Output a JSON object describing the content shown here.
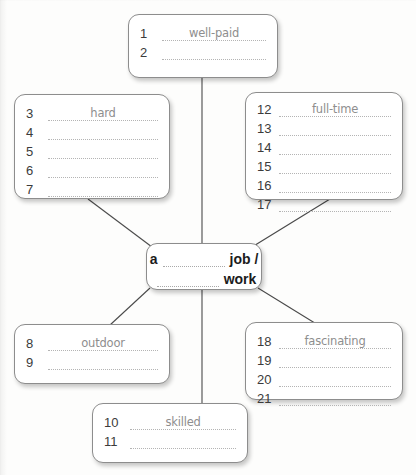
{
  "worksheet": {
    "center": {
      "lead": "a",
      "word1": "job /",
      "word2": "work"
    },
    "boxes": [
      {
        "name": "box-top",
        "items": [
          {
            "num": "1",
            "answer": "well-paid"
          },
          {
            "num": "2",
            "answer": ""
          }
        ]
      },
      {
        "name": "box-left-upper",
        "items": [
          {
            "num": "3",
            "answer": "hard"
          },
          {
            "num": "4",
            "answer": ""
          },
          {
            "num": "5",
            "answer": ""
          },
          {
            "num": "6",
            "answer": ""
          },
          {
            "num": "7",
            "answer": ""
          }
        ]
      },
      {
        "name": "box-right-upper",
        "items": [
          {
            "num": "12",
            "answer": "full-time"
          },
          {
            "num": "13",
            "answer": ""
          },
          {
            "num": "14",
            "answer": ""
          },
          {
            "num": "15",
            "answer": ""
          },
          {
            "num": "16",
            "answer": ""
          },
          {
            "num": "17",
            "answer": ""
          }
        ]
      },
      {
        "name": "box-left-lower",
        "items": [
          {
            "num": "8",
            "answer": "outdoor"
          },
          {
            "num": "9",
            "answer": ""
          }
        ]
      },
      {
        "name": "box-right-lower",
        "items": [
          {
            "num": "18",
            "answer": "fascinating"
          },
          {
            "num": "19",
            "answer": ""
          },
          {
            "num": "20",
            "answer": ""
          },
          {
            "num": "21",
            "answer": ""
          }
        ]
      },
      {
        "name": "box-bottom",
        "items": [
          {
            "num": "10",
            "answer": "skilled"
          },
          {
            "num": "11",
            "answer": ""
          }
        ]
      }
    ]
  },
  "colors": {
    "border": "#8d8d8d",
    "number": "#3b3b3b",
    "answer": "#8e8e8e",
    "dots": "#b4b4b4",
    "link": "#4a4a4a",
    "page": "#fdfdfc"
  }
}
